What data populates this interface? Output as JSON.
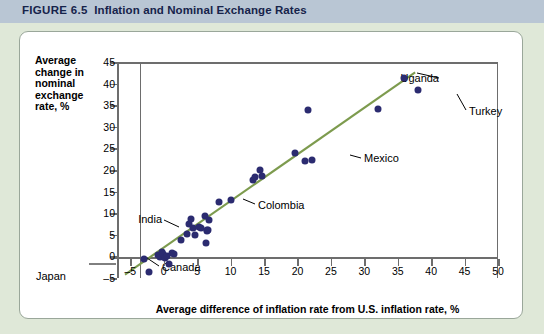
{
  "figure": {
    "number_label": "FIGURE 6.5",
    "title": "Inflation and Nominal Exchange Rates"
  },
  "chart_data": {
    "type": "scatter",
    "title": "Inflation and Nominal Exchange Rates",
    "xlabel": "Average difference of inflation rate from U.S. inflation rate, %",
    "ylabel": "Average change in nominal exchange rate, %",
    "xlim": [
      -7,
      50
    ],
    "ylim": [
      -5,
      45
    ],
    "xticks": [
      -5,
      0,
      5,
      10,
      15,
      20,
      25,
      30,
      35,
      40,
      45,
      50
    ],
    "yticks": [
      -5,
      0,
      5,
      10,
      15,
      20,
      25,
      30,
      35,
      40,
      45
    ],
    "grid": false,
    "legend": null,
    "series": [
      {
        "name": "Countries",
        "marker_color": "#2b2b70",
        "points": [
          {
            "x": -3.0,
            "y": -0.6
          },
          {
            "x": -2.2,
            "y": -3.6
          },
          {
            "x": -0.8,
            "y": 0.3
          },
          {
            "x": -0.5,
            "y": -0.2
          },
          {
            "x": -0.3,
            "y": 1.0
          },
          {
            "x": -0.1,
            "y": 0.6
          },
          {
            "x": 0.2,
            "y": -0.4
          },
          {
            "x": 0.5,
            "y": 0.1
          },
          {
            "x": 0.8,
            "y": -1.7,
            "label": "Canada"
          },
          {
            "x": 1.2,
            "y": 0.7
          },
          {
            "x": 1.6,
            "y": 0.5
          },
          {
            "x": 2.5,
            "y": 3.8
          },
          {
            "x": 3.4,
            "y": 5.2
          },
          {
            "x": 3.7,
            "y": 7.6
          },
          {
            "x": 4.0,
            "y": 8.6
          },
          {
            "x": 4.3,
            "y": 6.6
          },
          {
            "x": 4.6,
            "y": 5.0,
            "label": "India"
          },
          {
            "x": 5.2,
            "y": 6.8
          },
          {
            "x": 5.6,
            "y": 6.6
          },
          {
            "x": 6.2,
            "y": 9.4
          },
          {
            "x": 6.4,
            "y": 6.2
          },
          {
            "x": 6.5,
            "y": 5.8
          },
          {
            "x": 6.6,
            "y": 6.0
          },
          {
            "x": 6.8,
            "y": 8.4
          },
          {
            "x": 6.3,
            "y": 3.2
          },
          {
            "x": 8.2,
            "y": 12.6
          },
          {
            "x": 10.0,
            "y": 13.0,
            "label": "Colombia"
          },
          {
            "x": 13.3,
            "y": 17.6
          },
          {
            "x": 13.6,
            "y": 18.4
          },
          {
            "x": 14.4,
            "y": 20.0
          },
          {
            "x": 14.7,
            "y": 18.6
          },
          {
            "x": 19.6,
            "y": 24.0
          },
          {
            "x": 21.2,
            "y": 22.0
          },
          {
            "x": 22.1,
            "y": 22.4,
            "label": "Mexico"
          },
          {
            "x": 21.6,
            "y": 34.0
          },
          {
            "x": 32.0,
            "y": 34.2
          },
          {
            "x": 36.0,
            "y": 41.4,
            "label": "Uganda"
          },
          {
            "x": 38.0,
            "y": 38.6,
            "label": "Turkey"
          }
        ]
      }
    ],
    "trend_line": {
      "color": "#7d9b4e",
      "x_start": -5.8,
      "y_start": -4.2,
      "x_end": 37.6,
      "y_end": 42.6
    },
    "annotations": [
      {
        "text": "Uganda",
        "side": "right"
      },
      {
        "text": "Turkey",
        "side": "left"
      },
      {
        "text": "Mexico",
        "side": "left"
      },
      {
        "text": "Colombia",
        "side": "left"
      },
      {
        "text": "India",
        "side": "right"
      },
      {
        "text": "Canada",
        "side": "left"
      },
      {
        "text": "Japan",
        "side": "right"
      }
    ]
  },
  "colors": {
    "page_background": "#dfe8d8",
    "title_bar": "#b9c6d4",
    "title_text": "#16234a",
    "card_background": "#ffffff",
    "marker": "#2b2b70",
    "trend_line": "#7d9b4e",
    "axis": "#6d6d6d"
  }
}
